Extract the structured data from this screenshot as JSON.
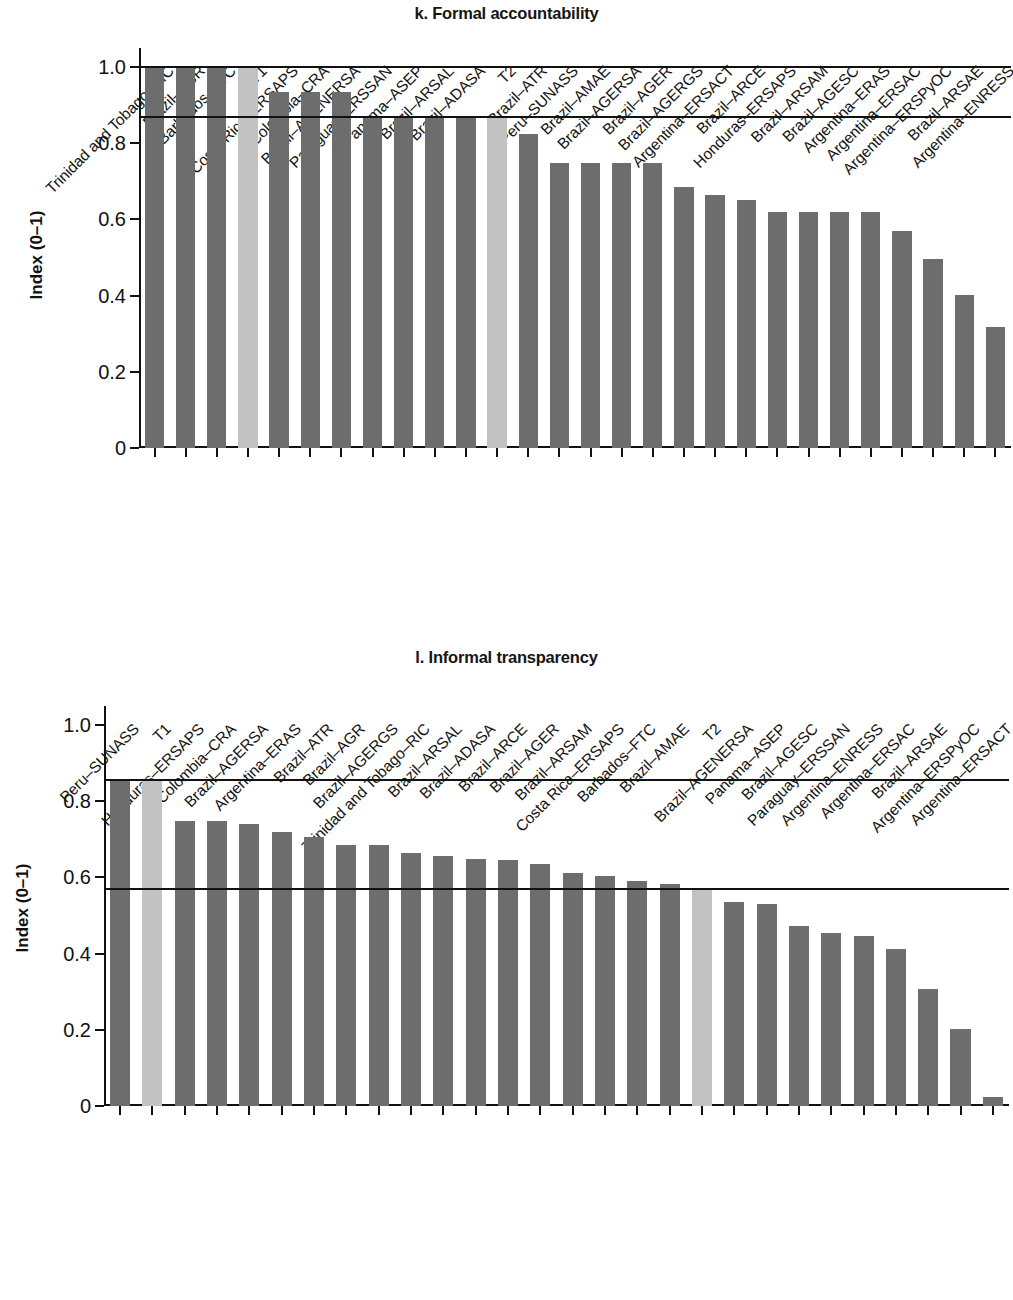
{
  "panels": [
    {
      "id": "k",
      "title": "k. Formal accountability",
      "ylabel": "Index (0–1)",
      "yticks": [
        "0",
        "0.2",
        "0.4",
        "0.6",
        "0.8",
        "1.0"
      ]
    },
    {
      "id": "l",
      "title": "l. Informal transparency",
      "ylabel": "Index (0–1)",
      "yticks": [
        "0",
        "0.2",
        "0.4",
        "0.6",
        "0.8",
        "1.0"
      ]
    }
  ],
  "chart_data": [
    {
      "type": "bar",
      "title": "k. Formal accountability",
      "xlabel": "",
      "ylabel": "Index (0–1)",
      "ylim": [
        0,
        1.05
      ],
      "ytick_values": [
        0,
        0.2,
        0.4,
        0.6,
        0.8,
        1.0
      ],
      "grid": false,
      "legend": "none",
      "reference_lines": [
        {
          "name": "T1",
          "value": 1.0
        },
        {
          "name": "T2",
          "value": 0.87
        }
      ],
      "highlight_color": "#c2c2c2",
      "bar_color": "#6d6d6d",
      "categories": [
        "Trinidad and Tobago–RIC",
        "Brazil–AGR",
        "Barbados–FTC",
        "T1",
        "Costa Rica–ERSAPS",
        "Colombia–CRA",
        "Brazil–AGENERSA",
        "Paraguay–ERSSAN",
        "Panama–ASEP",
        "Brazil–ARSAL",
        "Brazil–ADASA",
        "T2",
        "Brazil–ATR",
        "Peru–SUNASS",
        "Brazil–AMAE",
        "Brazil–AGERSA",
        "Brazil–AGER",
        "Brazil–AGERGS",
        "Argentina–ERSACT",
        "Brazil–ARCE",
        "Honduras–ERSAPS",
        "Brazil–ARSAM",
        "Brazil–AGESC",
        "Argentina–ERAS",
        "Argentina–ERSAC",
        "Argentina–ERSPyOC",
        "Brazil–ARSAE",
        "Argentina–ENRESS"
      ],
      "values": [
        1.0,
        1.0,
        1.0,
        1.0,
        0.935,
        0.935,
        0.935,
        0.87,
        0.87,
        0.87,
        0.87,
        0.87,
        0.825,
        0.748,
        0.748,
        0.748,
        0.748,
        0.685,
        0.665,
        0.652,
        0.62,
        0.62,
        0.62,
        0.62,
        0.57,
        0.495,
        0.402,
        0.318
      ],
      "highlight_indices": [
        3,
        11
      ]
    },
    {
      "type": "bar",
      "title": "l. Informal transparency",
      "xlabel": "",
      "ylabel": "Index (0–1)",
      "ylim": [
        0,
        1.05
      ],
      "ytick_values": [
        0,
        0.2,
        0.4,
        0.6,
        0.8,
        1.0
      ],
      "grid": false,
      "legend": "none",
      "reference_lines": [
        {
          "name": "T1",
          "value": 0.855
        },
        {
          "name": "T2",
          "value": 0.57
        }
      ],
      "highlight_color": "#c2c2c2",
      "bar_color": "#6d6d6d",
      "categories": [
        "Peru–SUNASS",
        "T1",
        "Honduras–ERSAPS",
        "Colombia–CRA",
        "Brazil–AGERSA",
        "Argentina–ERAS",
        "Brazil–ATR",
        "Brazil–AGR",
        "Brazil–AGERGS",
        "Trinidad and Tobago–RIC",
        "Brazil–ARSAL",
        "Brazil–ADASA",
        "Brazil–ARCE",
        "Brazil–AGER",
        "Brazil–ARSAM",
        "Costa Rica–ERSAPS",
        "Barbados–FTC",
        "Brazil–AMAE",
        "T2",
        "Brazil–AGENERSA",
        "Panama–ASEP",
        "Brazil–AGESC",
        "Paraguay–ERSSAN",
        "Argentina–ENRESS",
        "Argentina–ERSAC",
        "Brazil–ARSAE",
        "Argentina–ERSPyOC",
        "Argentina–ERSACT"
      ],
      "values": [
        0.855,
        0.855,
        0.748,
        0.748,
        0.74,
        0.72,
        0.705,
        0.685,
        0.685,
        0.665,
        0.657,
        0.648,
        0.645,
        0.635,
        0.612,
        0.603,
        0.59,
        0.583,
        0.57,
        0.535,
        0.53,
        0.472,
        0.455,
        0.447,
        0.413,
        0.307,
        0.203,
        0.023
      ],
      "highlight_indices": [
        1,
        18
      ]
    }
  ]
}
